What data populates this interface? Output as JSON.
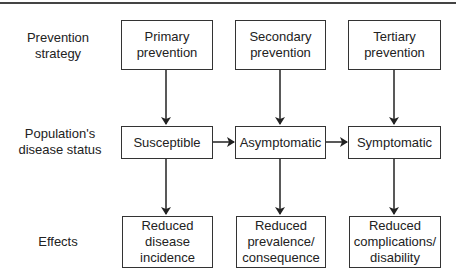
{
  "row_labels": {
    "strategy": "Prevention\nstrategy",
    "status": "Population's\ndisease status",
    "effects": "Effects"
  },
  "strategies": [
    {
      "label": "Primary\nprevention"
    },
    {
      "label": "Secondary\nprevention"
    },
    {
      "label": "Tertiary\nprevention"
    }
  ],
  "statuses": [
    {
      "label": "Susceptible"
    },
    {
      "label": "Asymptomatic"
    },
    {
      "label": "Symptomatic"
    }
  ],
  "effects": [
    {
      "label": "Reduced\ndisease\nincidence"
    },
    {
      "label": "Reduced\nprevalence/\nconsequence"
    },
    {
      "label": "Reduced\ncomplications/\ndisability"
    }
  ],
  "colors": {
    "line": "#333333",
    "background": "#ffffff",
    "text": "#222222"
  }
}
